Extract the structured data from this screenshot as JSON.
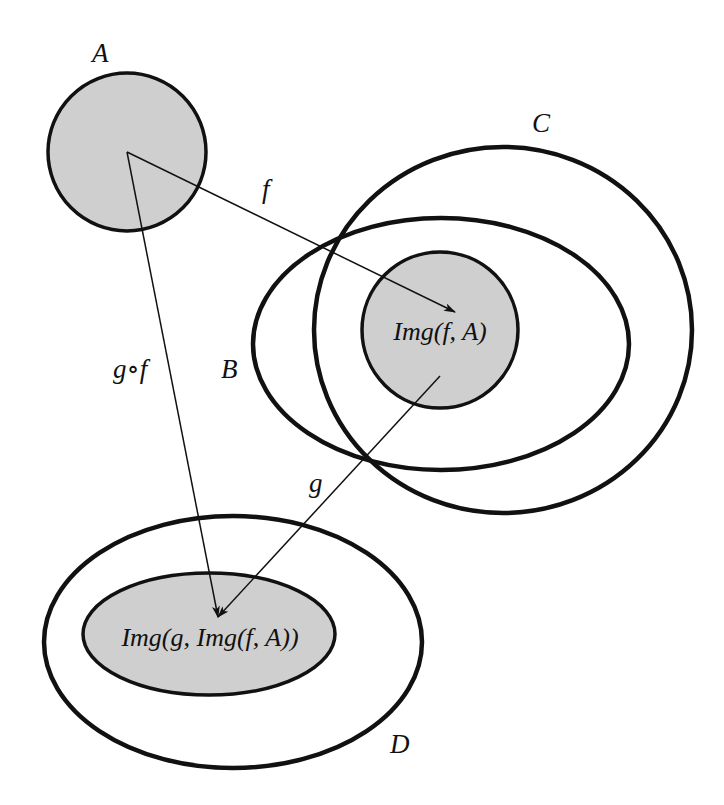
{
  "diagram": {
    "type": "set-mapping-diagram",
    "colors": {
      "fill": "#cfcfcf",
      "stroke": "#111111",
      "background": "#ffffff"
    },
    "sets": {
      "A": {
        "label": "A"
      },
      "B": {
        "label": "B"
      },
      "C": {
        "label": "C"
      },
      "D": {
        "label": "D"
      },
      "img_f_A": {
        "label": "Img(f, A)"
      },
      "img_g_img_f_A": {
        "label": "Img(g, Img(f, A))"
      }
    },
    "arrows": {
      "f": {
        "label": "f",
        "from": "A",
        "to": "Img(f, A)"
      },
      "g": {
        "label": "g",
        "from": "Img(f, A)",
        "to": "Img(g, Img(f, A))"
      },
      "gof": {
        "label": "g∘f",
        "from": "A",
        "to": "Img(g, Img(f, A))"
      }
    }
  }
}
